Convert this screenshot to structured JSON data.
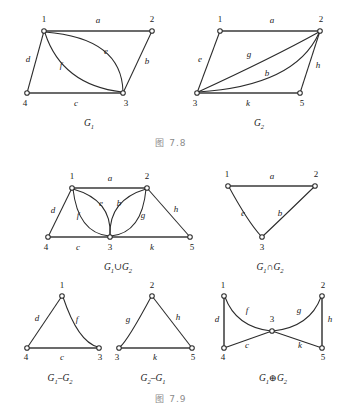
{
  "document": {
    "title": "Graph Operations Figures 7.8 and 7.9",
    "background_color": "#ffffff",
    "stroke_color": "#2b2b2b",
    "caption_color": "#8c8c8c"
  },
  "captions": {
    "top": "图  7.8",
    "bottom": "图  7.9"
  },
  "figures": [
    {
      "id": "G1",
      "name": "graph-g1",
      "caption": "G",
      "caption_sub": "1",
      "vertices": [
        {
          "id": "1",
          "label": "1",
          "x": 44,
          "y": 31,
          "label_x": 44,
          "label_y": 22
        },
        {
          "id": "2",
          "label": "2",
          "x": 152,
          "y": 31,
          "label_x": 152,
          "label_y": 22
        },
        {
          "id": "3",
          "label": "3",
          "x": 123,
          "y": 93,
          "label_x": 126,
          "label_y": 106
        },
        {
          "id": "4",
          "label": "4",
          "x": 27,
          "y": 93,
          "label_x": 25,
          "label_y": 106
        }
      ],
      "edges": [
        {
          "id": "a",
          "label": "a",
          "from": "1",
          "to": "2",
          "label_x": 98,
          "label_y": 23,
          "kind": "straight"
        },
        {
          "id": "b",
          "label": "b",
          "from": "2",
          "to": "3",
          "label_x": 147,
          "label_y": 64,
          "kind": "straight"
        },
        {
          "id": "c",
          "label": "c",
          "from": "4",
          "to": "3",
          "label_x": 76,
          "label_y": 106,
          "kind": "straight"
        },
        {
          "id": "d",
          "label": "d",
          "from": "1",
          "to": "4",
          "label_x": 28,
          "label_y": 62,
          "kind": "straight"
        },
        {
          "id": "e",
          "label": "e",
          "from": "1",
          "to": "3",
          "label_x": 106,
          "label_y": 54,
          "kind": "curve-up"
        },
        {
          "id": "f",
          "label": "f",
          "from": "1",
          "to": "3",
          "label_x": 61,
          "label_y": 68,
          "kind": "curve-down"
        }
      ]
    },
    {
      "id": "G2",
      "name": "graph-g2",
      "caption": "G",
      "caption_sub": "2",
      "vertices": [
        {
          "id": "1",
          "label": "1",
          "x": 220,
          "y": 31,
          "label_x": 220,
          "label_y": 22
        },
        {
          "id": "2",
          "label": "2",
          "x": 320,
          "y": 31,
          "label_x": 321,
          "label_y": 22
        },
        {
          "id": "3",
          "label": "3",
          "x": 197,
          "y": 93,
          "label_x": 195,
          "label_y": 106
        },
        {
          "id": "5",
          "label": "5",
          "x": 300,
          "y": 93,
          "label_x": 302,
          "label_y": 106
        }
      ],
      "edges": [
        {
          "id": "a",
          "label": "a",
          "from": "1",
          "to": "2",
          "label_x": 272,
          "label_y": 23,
          "kind": "straight"
        },
        {
          "id": "e",
          "label": "e",
          "from": "1",
          "to": "3",
          "label_x": 200,
          "label_y": 62,
          "kind": "straight"
        },
        {
          "id": "g",
          "label": "g",
          "from": "3",
          "to": "2",
          "label_x": 249,
          "label_y": 57,
          "kind": "curve-up"
        },
        {
          "id": "b",
          "label": "b",
          "from": "3",
          "to": "2",
          "label_x": 267,
          "label_y": 76,
          "kind": "curve-down"
        },
        {
          "id": "h",
          "label": "h",
          "from": "2",
          "to": "5",
          "label_x": 318,
          "label_y": 68,
          "kind": "straight"
        },
        {
          "id": "k",
          "label": "k",
          "from": "3",
          "to": "5",
          "label_x": 248,
          "label_y": 106,
          "kind": "straight"
        }
      ]
    },
    {
      "id": "G1uG2",
      "name": "graph-g1-union-g2",
      "caption": "G",
      "caption_sub": "1",
      "caption2": "∪G",
      "caption2_sub": "2",
      "vertices": [
        {
          "id": "1",
          "label": "1",
          "x": 72,
          "y": 188,
          "label_x": 72,
          "label_y": 179
        },
        {
          "id": "2",
          "label": "2",
          "x": 147,
          "y": 188,
          "label_x": 147,
          "label_y": 179
        },
        {
          "id": "3",
          "label": "3",
          "x": 110,
          "y": 237,
          "label_x": 110,
          "label_y": 250
        },
        {
          "id": "4",
          "label": "4",
          "x": 48,
          "y": 237,
          "label_x": 46,
          "label_y": 250
        },
        {
          "id": "5",
          "label": "5",
          "x": 190,
          "y": 237,
          "label_x": 192,
          "label_y": 250
        }
      ],
      "edges": [
        {
          "id": "a",
          "label": "a",
          "from": "1",
          "to": "2",
          "label_x": 110,
          "label_y": 181,
          "kind": "straight"
        },
        {
          "id": "d",
          "label": "d",
          "from": "1",
          "to": "4",
          "label_x": 53,
          "label_y": 213,
          "kind": "straight"
        },
        {
          "id": "f",
          "label": "f",
          "from": "1",
          "to": "3",
          "label_x": 78,
          "label_y": 218,
          "kind": "curve-left"
        },
        {
          "id": "e",
          "label": "e",
          "from": "1",
          "to": "3",
          "label_x": 101,
          "label_y": 206,
          "kind": "curve-right"
        },
        {
          "id": "b",
          "label": "b",
          "from": "2",
          "to": "3",
          "label_x": 119,
          "label_y": 206,
          "kind": "curve-left"
        },
        {
          "id": "g",
          "label": "g",
          "from": "2",
          "to": "3",
          "label_x": 143,
          "label_y": 218,
          "kind": "curve-right"
        },
        {
          "id": "h",
          "label": "h",
          "from": "2",
          "to": "5",
          "label_x": 176,
          "label_y": 212,
          "kind": "straight"
        },
        {
          "id": "c",
          "label": "c",
          "from": "4",
          "to": "3",
          "label_x": 78,
          "label_y": 250,
          "kind": "straight"
        },
        {
          "id": "k",
          "label": "k",
          "from": "3",
          "to": "5",
          "label_x": 152,
          "label_y": 250,
          "kind": "straight"
        }
      ]
    },
    {
      "id": "G1nG2",
      "name": "graph-g1-intersect-g2",
      "caption": "G",
      "caption_sub": "1",
      "caption2": "∩G",
      "caption2_sub": "2",
      "vertices": [
        {
          "id": "1",
          "label": "1",
          "x": 228,
          "y": 186,
          "label_x": 227,
          "label_y": 177
        },
        {
          "id": "2",
          "label": "2",
          "x": 315,
          "y": 186,
          "label_x": 316,
          "label_y": 177
        },
        {
          "id": "3",
          "label": "3",
          "x": 262,
          "y": 237,
          "label_x": 262,
          "label_y": 250
        }
      ],
      "edges": [
        {
          "id": "a",
          "label": "a",
          "from": "1",
          "to": "2",
          "label_x": 272,
          "label_y": 179,
          "kind": "straight"
        },
        {
          "id": "e",
          "label": "e",
          "from": "1",
          "to": "3",
          "label_x": 243,
          "label_y": 216,
          "kind": "curve-left"
        },
        {
          "id": "b",
          "label": "b",
          "from": "2",
          "to": "3",
          "label_x": 280,
          "label_y": 216,
          "kind": "curve-right"
        }
      ]
    },
    {
      "id": "G1mG2",
      "name": "graph-g1-minus-g2",
      "caption": "G",
      "caption_sub": "1",
      "caption2": "–G",
      "caption2_sub": "2",
      "vertices": [
        {
          "id": "1",
          "label": "1",
          "x": 62,
          "y": 296,
          "label_x": 62,
          "label_y": 288
        },
        {
          "id": "3",
          "label": "3",
          "x": 99,
          "y": 348,
          "label_x": 100,
          "label_y": 360
        },
        {
          "id": "4",
          "label": "4",
          "x": 27,
          "y": 348,
          "label_x": 26,
          "label_y": 360
        }
      ],
      "edges": [
        {
          "id": "d",
          "label": "d",
          "from": "1",
          "to": "4",
          "label_x": 37,
          "label_y": 321,
          "kind": "straight"
        },
        {
          "id": "f",
          "label": "f",
          "from": "1",
          "to": "3",
          "label_x": 77,
          "label_y": 322,
          "kind": "curve-right"
        },
        {
          "id": "c",
          "label": "c",
          "from": "4",
          "to": "3",
          "label_x": 62,
          "label_y": 360,
          "kind": "straight"
        }
      ]
    },
    {
      "id": "G2mG1",
      "name": "graph-g2-minus-g1",
      "caption": "G",
      "caption_sub": "2",
      "caption2": "–G",
      "caption2_sub": "1",
      "vertices": [
        {
          "id": "2",
          "label": "2",
          "x": 152,
          "y": 296,
          "label_x": 152,
          "label_y": 288
        },
        {
          "id": "3",
          "label": "3",
          "x": 119,
          "y": 348,
          "label_x": 117,
          "label_y": 360
        },
        {
          "id": "5",
          "label": "5",
          "x": 192,
          "y": 348,
          "label_x": 193,
          "label_y": 360
        }
      ],
      "edges": [
        {
          "id": "g",
          "label": "g",
          "from": "2",
          "to": "3",
          "label_x": 128,
          "label_y": 322,
          "kind": "curve-left"
        },
        {
          "id": "h",
          "label": "h",
          "from": "2",
          "to": "5",
          "label_x": 178,
          "label_y": 320,
          "kind": "straight"
        },
        {
          "id": "k",
          "label": "k",
          "from": "3",
          "to": "5",
          "label_x": 155,
          "label_y": 360,
          "kind": "straight"
        }
      ]
    },
    {
      "id": "G1xG2",
      "name": "graph-g1-symdiff-g2",
      "caption": "G",
      "caption_sub": "1",
      "caption2": "⊕G",
      "caption2_sub": "2",
      "vertices": [
        {
          "id": "1",
          "label": "1",
          "x": 224,
          "y": 296,
          "label_x": 223,
          "label_y": 288
        },
        {
          "id": "2",
          "label": "2",
          "x": 322,
          "y": 296,
          "label_x": 323,
          "label_y": 288
        },
        {
          "id": "3",
          "label": "3",
          "x": 272,
          "y": 331,
          "label_x": 272,
          "label_y": 322
        },
        {
          "id": "4",
          "label": "4",
          "x": 224,
          "y": 348,
          "label_x": 223,
          "label_y": 360
        },
        {
          "id": "5",
          "label": "5",
          "x": 322,
          "y": 348,
          "label_x": 323,
          "label_y": 360
        }
      ],
      "edges": [
        {
          "id": "d",
          "label": "d",
          "from": "1",
          "to": "4",
          "label_x": 217,
          "label_y": 322,
          "kind": "straight"
        },
        {
          "id": "f",
          "label": "f",
          "from": "1",
          "to": "3",
          "label_x": 247,
          "label_y": 313,
          "kind": "curve-right"
        },
        {
          "id": "c",
          "label": "c",
          "from": "4",
          "to": "3",
          "label_x": 247,
          "label_y": 348,
          "kind": "straight"
        },
        {
          "id": "g",
          "label": "g",
          "from": "2",
          "to": "3",
          "label_x": 299,
          "label_y": 313,
          "kind": "curve-left"
        },
        {
          "id": "k",
          "label": "k",
          "from": "3",
          "to": "5",
          "label_x": 300,
          "label_y": 348,
          "kind": "straight"
        },
        {
          "id": "h",
          "label": "h",
          "from": "2",
          "to": "5",
          "label_x": 330,
          "label_y": 322,
          "kind": "straight"
        }
      ]
    }
  ]
}
